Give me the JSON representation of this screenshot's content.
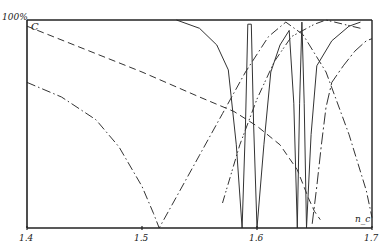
{
  "chart_data": {
    "type": "line",
    "title": "",
    "xlabel": "n_c",
    "ylabel": "100%",
    "y_top_label": "100%",
    "curve_label": "C",
    "xlim": [
      1.4,
      1.7
    ],
    "ylim": [
      0,
      100
    ],
    "xticks": [
      "1.4",
      "1.5",
      "1.6",
      "1.7"
    ],
    "grid": false,
    "legend": "none",
    "series": [
      {
        "name": "dashed (C)",
        "style": "dashed",
        "points": [
          [
            1.4,
            97
          ],
          [
            1.45,
            86
          ],
          [
            1.5,
            75
          ],
          [
            1.55,
            63
          ],
          [
            1.58,
            56
          ],
          [
            1.6,
            49
          ],
          [
            1.62,
            40
          ],
          [
            1.635,
            28
          ],
          [
            1.645,
            14
          ],
          [
            1.65,
            8
          ],
          [
            1.655,
            4
          ]
        ]
      },
      {
        "name": "dash-dot (left V, min at 1.515)",
        "style": "dashdot",
        "points": [
          [
            1.4,
            70
          ],
          [
            1.43,
            63
          ],
          [
            1.46,
            52
          ],
          [
            1.48,
            39
          ],
          [
            1.5,
            20
          ],
          [
            1.51,
            7
          ],
          [
            1.515,
            0
          ],
          [
            1.53,
            15
          ],
          [
            1.55,
            35
          ],
          [
            1.57,
            55
          ],
          [
            1.59,
            75
          ],
          [
            1.61,
            92
          ],
          [
            1.625,
            99
          ],
          [
            1.64,
            93
          ],
          [
            1.66,
            75
          ],
          [
            1.68,
            45
          ],
          [
            1.695,
            18
          ],
          [
            1.7,
            5
          ]
        ]
      },
      {
        "name": "solid (oscillating)",
        "style": "solid",
        "points": [
          [
            1.53,
            100
          ],
          [
            1.55,
            96
          ],
          [
            1.565,
            88
          ],
          [
            1.575,
            76
          ],
          [
            1.582,
            40
          ],
          [
            1.587,
            0
          ],
          [
            1.59,
            50
          ],
          [
            1.592,
            98
          ],
          [
            1.595,
            98
          ],
          [
            1.597,
            50
          ],
          [
            1.6,
            0
          ],
          [
            1.606,
            40
          ],
          [
            1.612,
            75
          ],
          [
            1.62,
            88
          ],
          [
            1.628,
            95
          ],
          [
            1.632,
            60
          ],
          [
            1.635,
            0
          ],
          [
            1.637,
            60
          ],
          [
            1.639,
            99
          ],
          [
            1.641,
            60
          ],
          [
            1.643,
            0
          ],
          [
            1.647,
            45
          ],
          [
            1.652,
            78
          ],
          [
            1.665,
            90
          ],
          [
            1.68,
            97
          ],
          [
            1.69,
            99
          ]
        ]
      },
      {
        "name": "dash-dot-dot (right V, min at 1.655)",
        "style": "dashdotdot",
        "points": [
          [
            1.57,
            12
          ],
          [
            1.585,
            40
          ],
          [
            1.6,
            62
          ],
          [
            1.615,
            80
          ],
          [
            1.63,
            92
          ],
          [
            1.65,
            98
          ],
          [
            1.66,
            100
          ],
          [
            1.675,
            98
          ],
          [
            1.69,
            96
          ]
        ]
      },
      {
        "name": "long-dash-dot (rising right)",
        "style": "longdashdot",
        "points": [
          [
            1.648,
            2
          ],
          [
            1.652,
            20
          ],
          [
            1.656,
            40
          ],
          [
            1.66,
            58
          ],
          [
            1.665,
            70
          ],
          [
            1.675,
            78
          ],
          [
            1.685,
            85
          ],
          [
            1.695,
            90
          ],
          [
            1.7,
            91
          ]
        ]
      }
    ]
  }
}
